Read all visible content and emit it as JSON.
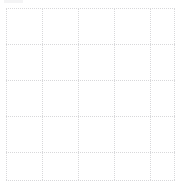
{
  "canvas": {
    "width": 180,
    "height": 187,
    "background_color": "#ffffff",
    "description": "Blank white page with a faint light-gray dotted grid"
  },
  "artifact": {
    "label": "faint-gray-smudge",
    "color": "#f2f2f3",
    "x": 4,
    "y": 0,
    "width": 19,
    "height": 3
  },
  "grid": {
    "line_style": "dotted",
    "line_width": 1,
    "line_color": "#d8d8da",
    "columns": 5,
    "rows": 5,
    "column_spacing": 36,
    "row_spacing": 36,
    "vertical_lines": [
      {
        "name": "v0",
        "x": 6,
        "y": 8,
        "length": 172
      },
      {
        "name": "v1",
        "x": 42,
        "y": 8,
        "length": 172
      },
      {
        "name": "v2",
        "x": 78,
        "y": 8,
        "length": 172
      },
      {
        "name": "v3",
        "x": 114,
        "y": 8,
        "length": 172
      },
      {
        "name": "v4",
        "x": 150,
        "y": 8,
        "length": 172
      },
      {
        "name": "v5",
        "x": 174,
        "y": 8,
        "length": 172
      }
    ],
    "horizontal_lines": [
      {
        "name": "h0",
        "y": 8,
        "x": 6,
        "length": 169
      },
      {
        "name": "h1",
        "y": 44,
        "x": 6,
        "length": 169
      },
      {
        "name": "h2",
        "y": 80,
        "x": 6,
        "length": 169
      },
      {
        "name": "h3",
        "y": 116,
        "x": 6,
        "length": 169
      },
      {
        "name": "h4",
        "y": 152,
        "x": 6,
        "length": 169
      },
      {
        "name": "h5",
        "y": 180,
        "x": 6,
        "length": 169
      }
    ]
  }
}
